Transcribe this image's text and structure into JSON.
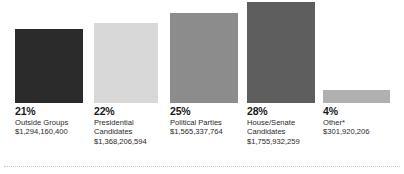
{
  "chart_data": {
    "type": "bar",
    "title": "",
    "xlabel": "",
    "ylabel": "",
    "grid": false,
    "legend": "none",
    "ylim": [
      0,
      30
    ],
    "categories": [
      "Outside Groups",
      "Presidential Candidates",
      "Political Parties",
      "House/Senate Candidates",
      "Other*"
    ],
    "values": [
      21,
      22,
      25,
      28,
      4
    ],
    "value_suffix": "%",
    "amounts": [
      "$1,294,160,400",
      "$1,368,206,594",
      "$1,565,337,764",
      "$1,755,932,259",
      "$301,920,206"
    ],
    "amounts_numeric": [
      1294160400,
      1368206594,
      1565337764,
      1755932259,
      301920206
    ],
    "colors": [
      "#2b2b2b",
      "#d8d8d8",
      "#8c8c8c",
      "#5e5e5e",
      "#b0b0b0"
    ]
  },
  "bars": [
    {
      "percent": "21%",
      "category_line1": "Outside Groups",
      "category_line2": "",
      "amount": "$1,294,160,400",
      "color": "#2b2b2b"
    },
    {
      "percent": "22%",
      "category_line1": "Presidential",
      "category_line2": "Candidates",
      "amount": "$1,368,206,594",
      "color": "#d8d8d8"
    },
    {
      "percent": "25%",
      "category_line1": "Political Parties",
      "category_line2": "",
      "amount": "$1,565,337,764",
      "color": "#8c8c8c"
    },
    {
      "percent": "28%",
      "category_line1": "House/Senate",
      "category_line2": "Candidates",
      "amount": "$1,755,932,259",
      "color": "#5e5e5e"
    },
    {
      "percent": "4%",
      "category_line1": "Other*",
      "category_line2": "",
      "amount": "$301,920,206",
      "color": "#b0b0b0"
    }
  ],
  "layout": {
    "bar_geometry": [
      {
        "left": 15,
        "width": 68,
        "top": 29
      },
      {
        "left": 94,
        "width": 64,
        "top": 23
      },
      {
        "left": 170,
        "width": 68,
        "top": 13
      },
      {
        "left": 247,
        "width": 68,
        "top": 2
      },
      {
        "left": 323,
        "width": 67,
        "top": 90
      }
    ],
    "label_left": [
      15,
      94,
      170,
      247,
      323
    ],
    "baseline_y": 103,
    "rule_color": "#c9c9c9"
  }
}
